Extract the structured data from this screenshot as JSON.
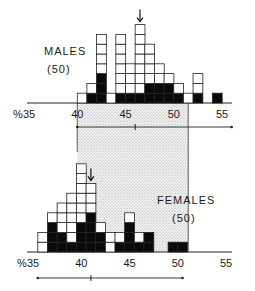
{
  "chart_data": [
    {
      "type": "bar",
      "title": "MALES",
      "sample_label": "(50)",
      "xlabel_prefix": "%",
      "tick_labels": [
        "35",
        "40",
        "45",
        "50",
        "55"
      ],
      "ticks": [
        35,
        40,
        45,
        50,
        55
      ],
      "xlim": [
        35,
        56
      ],
      "bins": [
        40,
        41,
        42,
        43,
        44,
        45,
        46,
        47,
        48,
        49,
        50,
        51,
        52,
        53,
        54
      ],
      "series": [
        {
          "name": "total",
          "values": [
            1,
            2,
            7,
            1,
            7,
            4,
            8,
            6,
            4,
            3,
            2,
            1,
            3,
            0,
            1
          ]
        },
        {
          "name": "filled",
          "values": [
            0,
            1,
            3,
            0,
            1,
            1,
            1,
            2,
            2,
            2,
            1,
            0,
            1,
            0,
            1
          ]
        }
      ],
      "arrow_at": 46.5,
      "range_bar": {
        "min": 40,
        "mean": 46,
        "max": 56
      },
      "shaded_region": [
        40,
        51.5
      ]
    },
    {
      "type": "bar",
      "title": "FEMALES",
      "sample_label": "(50)",
      "xlabel_prefix": "%",
      "tick_labels": [
        "35",
        "40",
        "45",
        "50",
        "55"
      ],
      "ticks": [
        35,
        40,
        45,
        50,
        55
      ],
      "xlim": [
        35,
        56
      ],
      "bins": [
        35.5,
        36.5,
        37.5,
        38.5,
        39.5,
        40.5,
        41.5,
        42.5,
        43.5,
        44.5,
        45.5,
        46.5,
        49,
        50
      ],
      "series": [
        {
          "name": "total",
          "values": [
            2,
            4,
            5,
            6,
            9,
            7,
            3,
            2,
            2,
            4,
            2,
            2,
            1,
            1
          ]
        },
        {
          "name": "filled",
          "values": [
            0,
            3,
            2,
            1,
            3,
            4,
            2,
            0,
            1,
            3,
            1,
            2,
            1,
            1
          ]
        }
      ],
      "arrow_at": 41,
      "range_bar": {
        "min": 35.5,
        "mean": 41,
        "max": 50.5
      },
      "shaded_region": [
        40,
        51.5
      ]
    }
  ]
}
